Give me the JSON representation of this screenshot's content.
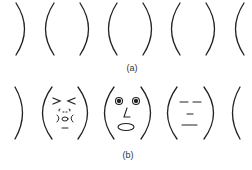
{
  "figure": {
    "panel_a": {
      "label": "(a)",
      "description": "Row of paired face outline arcs without features",
      "arcs": [
        ")",
        "(",
        ")",
        "(",
        ")",
        "(",
        ")",
        "("
      ]
    },
    "panel_b": {
      "label": "(b)",
      "description": "Row of face outlines with drawn features",
      "faces": [
        {
          "name": "squinting-face",
          "features": [
            "closed squinting eyes > <",
            "cheek marks",
            "small open mouth"
          ]
        },
        {
          "name": "surprised-face",
          "features": [
            "wide round eyes",
            "nose",
            "large open oval mouth"
          ]
        },
        {
          "name": "neutral-face",
          "features": [
            "half-closed eyes",
            "small nose line",
            "flat mouth line"
          ]
        }
      ]
    },
    "stroke_color": "#222222"
  }
}
